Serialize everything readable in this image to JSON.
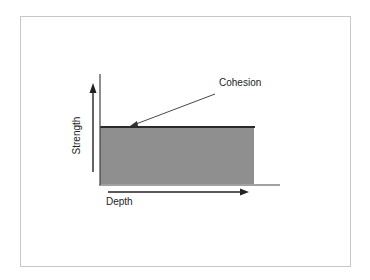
{
  "diagram": {
    "labels": {
      "cohesion": "Cohesion",
      "strength": "Strength",
      "depth": "Depth"
    },
    "colors": {
      "fill": "#8f8f8f",
      "line": "#2a2a2a",
      "frame": "#c8c8c8"
    }
  }
}
